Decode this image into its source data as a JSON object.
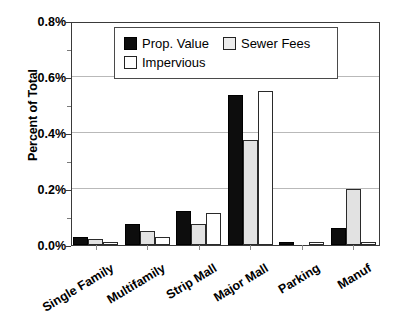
{
  "chart_data": {
    "type": "bar",
    "title": "",
    "xlabel": "",
    "ylabel": "Percent of Total",
    "ylim": [
      0,
      0.8
    ],
    "ytick_labels": [
      "0.0%",
      "0.2%",
      "0.4%",
      "0.6%",
      "0.8%"
    ],
    "ytick_values": [
      0.0,
      0.2,
      0.4,
      0.6,
      0.8
    ],
    "yminor_values": [
      0.1,
      0.3,
      0.5,
      0.7
    ],
    "grid": "horizontal",
    "legend_position": "top-center",
    "categories": [
      "Single Family",
      "Multifamily",
      "Strip Mall",
      "Major Mall",
      "Parking",
      "Manuf"
    ],
    "series": [
      {
        "name": "Prop. Value",
        "fill": "#0d0d0d",
        "values": [
          0.03,
          0.075,
          0.12,
          0.535,
          0.01,
          0.06
        ]
      },
      {
        "name": "Sewer Fees",
        "fill": "#e2e2e2",
        "values": [
          0.02,
          0.05,
          0.075,
          0.375,
          0.0,
          0.2
        ]
      },
      {
        "name": "Impervious",
        "fill": "#ffffff",
        "values": [
          0.01,
          0.03,
          0.115,
          0.55,
          0.01,
          0.012
        ]
      }
    ],
    "units": "percent"
  },
  "axes": {
    "y_title": "Percent of Total",
    "y_ticks": [
      {
        "label": "0.8%",
        "value": 0.8
      },
      {
        "label": "0.6%",
        "value": 0.6
      },
      {
        "label": "0.4%",
        "value": 0.4
      },
      {
        "label": "0.2%",
        "value": 0.2
      },
      {
        "label": "0.0%",
        "value": 0.0
      }
    ],
    "x_categories": [
      {
        "label": "Single Family"
      },
      {
        "label": "Multifamily"
      },
      {
        "label": "Strip Mall"
      },
      {
        "label": "Major Mall"
      },
      {
        "label": "Parking"
      },
      {
        "label": "Manuf"
      }
    ]
  },
  "legend": {
    "entries": [
      {
        "label": "Prop. Value",
        "swatch": "black-filled-square"
      },
      {
        "label": "Sewer Fees",
        "swatch": "light-gray-square"
      },
      {
        "label": "Impervious",
        "swatch": "white-outline-square"
      }
    ]
  }
}
